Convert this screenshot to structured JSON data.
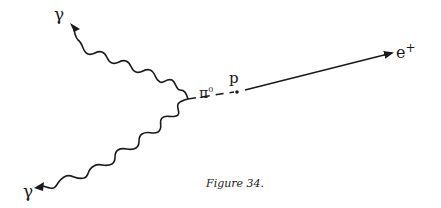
{
  "figure": {
    "caption": "Figure 34.",
    "labels": {
      "gamma_upper": "γ",
      "gamma_lower": "γ",
      "pion": "π",
      "pion_charge": "0",
      "proton": "p",
      "positron": "e",
      "positron_charge": "+"
    },
    "colors": {
      "line": "#1a1a1a",
      "background": "#ffffff"
    }
  }
}
